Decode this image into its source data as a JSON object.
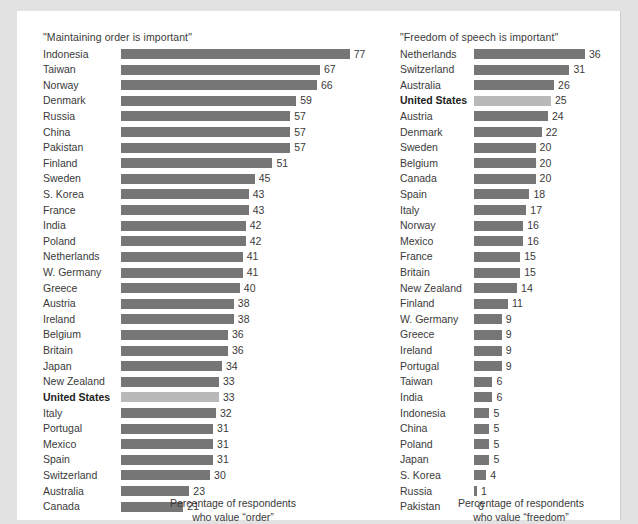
{
  "figure": {
    "bar_color": "#767676",
    "highlight_bar_color": "#b9b9b9",
    "text_color": "#3a3a3a",
    "background": "#ffffff",
    "page_margin_color": "#e2e2e2"
  },
  "panels": {
    "order": {
      "title": "\"Maintaining order is important\"",
      "caption_line1": "Percentage of respondents",
      "caption_line2": "who value “order”"
    },
    "speech": {
      "title": "\"Freedom of speech is important\"",
      "caption_line1": "Percentage of respondents",
      "caption_line2": "who value “freedom”"
    }
  },
  "chart_data": [
    {
      "type": "bar",
      "id": "order",
      "orientation": "horizontal",
      "title": "\"Maintaining order is important\"",
      "xlabel": "Percentage of respondents who value “order”",
      "ylabel": "",
      "xlim": [
        0,
        77
      ],
      "grid": false,
      "legend": false,
      "highlight": "United States",
      "categories": [
        "Indonesia",
        "Taiwan",
        "Norway",
        "Denmark",
        "Russia",
        "China",
        "Pakistan",
        "Finland",
        "Sweden",
        "S. Korea",
        "France",
        "India",
        "Poland",
        "Netherlands",
        "W. Germany",
        "Greece",
        "Austria",
        "Ireland",
        "Belgium",
        "Britain",
        "Japan",
        "New Zealand",
        "United States",
        "Italy",
        "Portugal",
        "Mexico",
        "Spain",
        "Switzerland",
        "Australia",
        "Canada"
      ],
      "values": [
        77,
        67,
        66,
        59,
        57,
        57,
        57,
        51,
        45,
        43,
        43,
        42,
        42,
        41,
        41,
        40,
        38,
        38,
        36,
        36,
        34,
        33,
        33,
        32,
        31,
        31,
        31,
        30,
        23,
        21
      ]
    },
    {
      "type": "bar",
      "id": "speech",
      "orientation": "horizontal",
      "title": "\"Freedom of speech is important\"",
      "xlabel": "Percentage of respondents who value “freedom”",
      "ylabel": "",
      "xlim": [
        0,
        36
      ],
      "grid": false,
      "legend": false,
      "highlight": "United States",
      "categories": [
        "Netherlands",
        "Switzerland",
        "Australia",
        "United States",
        "Austria",
        "Denmark",
        "Sweden",
        "Belgium",
        "Canada",
        "Spain",
        "Italy",
        "Norway",
        "Mexico",
        "France",
        "Britain",
        "New Zealand",
        "Finland",
        "W. Germany",
        "Greece",
        "Ireland",
        "Portugal",
        "Taiwan",
        "India",
        "Indonesia",
        "China",
        "Poland",
        "Japan",
        "S. Korea",
        "Russia",
        "Pakistan"
      ],
      "values": [
        36,
        31,
        26,
        25,
        24,
        22,
        20,
        20,
        20,
        18,
        17,
        16,
        16,
        15,
        15,
        14,
        11,
        9,
        9,
        9,
        9,
        6,
        6,
        5,
        5,
        5,
        5,
        4,
        1,
        0
      ]
    }
  ]
}
